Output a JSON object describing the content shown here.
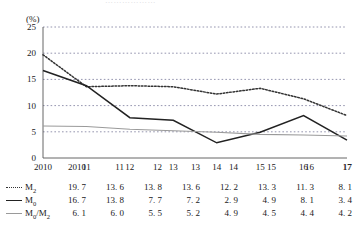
{
  "title": "………………",
  "chart_data": {
    "type": "line",
    "title": "",
    "xlabel": "",
    "ylabel": "(%)",
    "yunit": "(%)",
    "ylim": [
      0,
      25
    ],
    "yticks": [
      0,
      5,
      10,
      15,
      20,
      25
    ],
    "grid": true,
    "grid_style": "dotted-horizontal",
    "legend_position": "table-below",
    "categories": [
      "2010",
      "11",
      "12",
      "13",
      "14",
      "15",
      "16",
      "17"
    ],
    "series": [
      {
        "name": "M2",
        "label": "M",
        "sub": "2",
        "style": "dotted",
        "color": "#333333",
        "values": [
          19.7,
          13.6,
          13.8,
          13.6,
          12.2,
          13.3,
          11.3,
          8.1
        ]
      },
      {
        "name": "M0",
        "label": "M",
        "sub": "0",
        "style": "solid",
        "color": "#222222",
        "values": [
          16.7,
          13.8,
          7.7,
          7.2,
          2.9,
          4.9,
          8.1,
          3.4
        ]
      },
      {
        "name": "M0/M2",
        "label": "M",
        "sub": "0",
        "label2": "/M",
        "sub2": "2",
        "style": "solid-gray",
        "color": "#9a9a9a",
        "values": [
          6.1,
          6.0,
          5.5,
          5.2,
          4.9,
          4.5,
          4.4,
          4.2
        ]
      }
    ]
  },
  "table": {
    "header": [
      "2010",
      "11",
      "12",
      "13",
      "14",
      "15",
      "16",
      "17"
    ],
    "rows": [
      {
        "legend_style": "dotted",
        "label": "M",
        "sub": "2",
        "values": [
          "19. 7",
          "13. 6",
          "13. 8",
          "13. 6",
          "12. 2",
          "13. 3",
          "11. 3",
          "8. 1"
        ]
      },
      {
        "legend_style": "solid",
        "label": "M",
        "sub": "0",
        "values": [
          "16. 7",
          "13. 8",
          "7. 7",
          "7. 2",
          "2. 9",
          "4. 9",
          "8. 1",
          "3. 4"
        ]
      },
      {
        "legend_style": "gray",
        "label": "M",
        "sub": "0",
        "label2": "/M",
        "sub2": "2",
        "values": [
          "6. 1",
          "6. 0",
          "5. 5",
          "5. 2",
          "4. 9",
          "4. 5",
          "4. 4",
          "4. 2"
        ]
      }
    ]
  }
}
